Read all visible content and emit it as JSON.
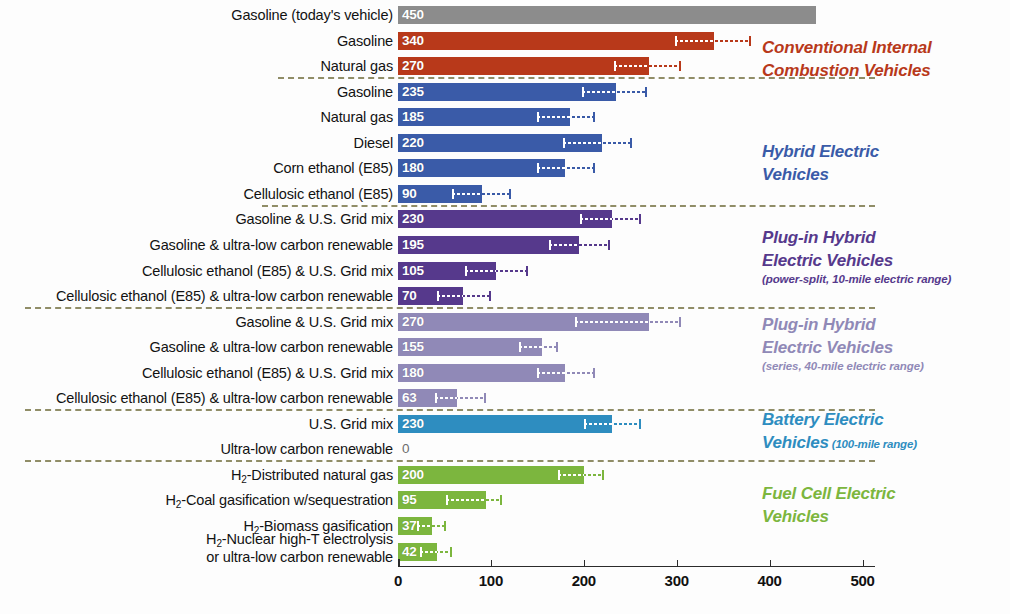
{
  "chart_data": {
    "type": "bar",
    "orientation": "horizontal",
    "title": "",
    "xlabel": "",
    "ylabel": "",
    "xlim": [
      0,
      500
    ],
    "xticks": [
      0,
      100,
      200,
      300,
      400,
      500
    ],
    "grid": false,
    "legend_position": "right",
    "categories": [
      "Gasoline (today's vehicle)",
      "Gasoline",
      "Natural gas",
      "Gasoline",
      "Natural gas",
      "Diesel",
      "Corn ethanol (E85)",
      "Cellulosic ethanol (E85)",
      "Gasoline & U.S. Grid mix",
      "Gasoline & ultra-low carbon renewable",
      "Cellulosic ethanol (E85) & U.S. Grid mix",
      "Cellulosic ethanol (E85) & ultra-low carbon renewable",
      "Gasoline & U.S. Grid mix",
      "Gasoline & ultra-low carbon renewable",
      "Cellulosic ethanol (E85) & U.S. Grid mix",
      "Cellulosic ethanol (E85) & ultra-low carbon renewable",
      "U.S. Grid mix",
      "Ultra-low carbon renewable",
      "H2-Distributed natural gas",
      "H2-Coal gasification w/sequestration",
      "H2-Biomass gasification",
      "H2-Nuclear high-T electrolysis or ultra-low carbon renewable"
    ],
    "values": [
      450,
      340,
      270,
      235,
      185,
      220,
      180,
      90,
      230,
      195,
      105,
      70,
      270,
      155,
      180,
      63,
      230,
      0,
      200,
      95,
      37,
      42
    ]
  },
  "colors": {
    "reference_gray": "#8c8c8c",
    "conventional_red": "#b8391a",
    "hybrid_blue": "#3a5ba8",
    "phev10_purple": "#56398c",
    "phev40_purple": "#9089b7",
    "bev_teal": "#2e8dc0",
    "fuelcell_green": "#7cb63e",
    "separator": "#7d7a4e",
    "axis": "#2b2b2b"
  },
  "rows": [
    {
      "label_html": "Gasoline (today's vehicle)",
      "value": 450,
      "value_text": "450",
      "color_key": "reference_gray",
      "err_lo": null,
      "err_hi": null,
      "value_dark": false
    },
    {
      "label_html": "Gasoline",
      "value": 340,
      "value_text": "340",
      "color_key": "conventional_red",
      "err_lo": 298,
      "err_hi": 380,
      "value_dark": false
    },
    {
      "label_html": "Natural gas",
      "value": 270,
      "value_text": "270",
      "color_key": "conventional_red",
      "err_lo": 232,
      "err_hi": 305,
      "value_dark": false
    },
    {
      "label_html": "Gasoline",
      "value": 235,
      "value_text": "235",
      "color_key": "hybrid_blue",
      "err_lo": 198,
      "err_hi": 268,
      "value_dark": false
    },
    {
      "label_html": "Natural gas",
      "value": 185,
      "value_text": "185",
      "color_key": "hybrid_blue",
      "err_lo": 150,
      "err_hi": 212,
      "value_dark": false
    },
    {
      "label_html": "Diesel",
      "value": 220,
      "value_text": "220",
      "color_key": "hybrid_blue",
      "err_lo": 178,
      "err_hi": 252,
      "value_dark": false
    },
    {
      "label_html": "Corn ethanol (E85)",
      "value": 180,
      "value_text": "180",
      "color_key": "hybrid_blue",
      "err_lo": 150,
      "err_hi": 212,
      "value_dark": false
    },
    {
      "label_html": "Cellulosic ethanol (E85)",
      "value": 90,
      "value_text": "90",
      "color_key": "hybrid_blue",
      "err_lo": 58,
      "err_hi": 122,
      "value_dark": false
    },
    {
      "label_html": "Gasoline &amp; U.S. Grid mix",
      "value": 230,
      "value_text": "230",
      "color_key": "phev10_purple",
      "err_lo": 196,
      "err_hi": 262,
      "value_dark": false
    },
    {
      "label_html": "Gasoline &amp; ultra-low carbon renewable",
      "value": 195,
      "value_text": "195",
      "color_key": "phev10_purple",
      "err_lo": 163,
      "err_hi": 228,
      "value_dark": false
    },
    {
      "label_html": "Cellulosic ethanol (E85) &amp; U.S. Grid mix",
      "value": 105,
      "value_text": "105",
      "color_key": "phev10_purple",
      "err_lo": 72,
      "err_hi": 140,
      "value_dark": false
    },
    {
      "label_html": "Cellulosic ethanol (E85) &amp; ultra-low carbon renewable",
      "value": 70,
      "value_text": "70",
      "color_key": "phev10_purple",
      "err_lo": 42,
      "err_hi": 100,
      "value_dark": false
    },
    {
      "label_html": "Gasoline &amp; U.S. Grid mix",
      "value": 270,
      "value_text": "270",
      "color_key": "phev40_purple",
      "err_lo": 190,
      "err_hi": 305,
      "value_dark": false
    },
    {
      "label_html": "Gasoline &amp; ultra-low carbon renewable",
      "value": 155,
      "value_text": "155",
      "color_key": "phev40_purple",
      "err_lo": 130,
      "err_hi": 172,
      "value_dark": false
    },
    {
      "label_html": "Cellulosic ethanol (E85) &amp; U.S. Grid mix",
      "value": 180,
      "value_text": "180",
      "color_key": "phev40_purple",
      "err_lo": 150,
      "err_hi": 212,
      "value_dark": false
    },
    {
      "label_html": "Cellulosic ethanol (E85) &amp; ultra-low carbon renewable",
      "value": 63,
      "value_text": "63",
      "color_key": "phev40_purple",
      "err_lo": 40,
      "err_hi": 95,
      "value_dark": false
    },
    {
      "label_html": "U.S. Grid mix",
      "value": 230,
      "value_text": "230",
      "color_key": "bev_teal",
      "err_lo": 200,
      "err_hi": 262,
      "value_dark": false
    },
    {
      "label_html": "Ultra-low carbon renewable",
      "value": 0,
      "value_text": "0",
      "color_key": "bev_teal",
      "err_lo": null,
      "err_hi": null,
      "value_dark": true
    },
    {
      "label_html": "H<sub>2</sub>-Distributed natural gas",
      "value": 200,
      "value_text": "200",
      "color_key": "fuelcell_green",
      "err_lo": 172,
      "err_hi": 222,
      "value_dark": false
    },
    {
      "label_html": "H<sub>2</sub>-Coal gasification w/sequestration",
      "value": 95,
      "value_text": "95",
      "color_key": "fuelcell_green",
      "err_lo": 52,
      "err_hi": 112,
      "value_dark": false
    },
    {
      "label_html": "H<sub>2</sub>-Biomass gasification",
      "value": 37,
      "value_text": "37",
      "color_key": "fuelcell_green",
      "err_lo": 20,
      "err_hi": 52,
      "value_dark": false
    },
    {
      "label_html": "H<sub>2</sub>-Nuclear high-T electrolysis<br>or ultra-low carbon renewable",
      "value": 42,
      "value_text": "42",
      "color_key": "fuelcell_green",
      "err_lo": 24,
      "err_hi": 58,
      "value_dark": false
    }
  ],
  "separators": [
    {
      "after_row": 2
    },
    {
      "after_row": 7
    },
    {
      "after_row": 11
    },
    {
      "after_row": 15
    },
    {
      "after_row": 17
    }
  ],
  "groups": [
    {
      "name": "conventional-internal-combustion-vehicles",
      "title": "Conventional Internal\nCombustion Vehicles",
      "subtitle": "",
      "subtitle_inline": "",
      "color_key": "conventional_red",
      "top": 36
    },
    {
      "name": "hybrid-electric-vehicles",
      "title": "Hybrid Electric\nVehicles",
      "subtitle": "",
      "subtitle_inline": "",
      "color_key": "hybrid_blue",
      "top": 140
    },
    {
      "name": "plug-in-hybrid-electric-vehicles-power-split",
      "title": "Plug-in Hybrid\nElectric Vehicles",
      "subtitle": "(power-split, 10-mile electric range)",
      "subtitle_inline": "",
      "color_key": "phev10_purple",
      "top": 226
    },
    {
      "name": "plug-in-hybrid-electric-vehicles-series",
      "title": "Plug-in Hybrid\nElectric Vehicles",
      "subtitle": "(series, 40-mile electric range)",
      "subtitle_inline": "",
      "color_key": "phev40_purple",
      "top": 313
    },
    {
      "name": "battery-electric-vehicles",
      "title": "Battery Electric\nVehicles",
      "subtitle": "",
      "subtitle_inline": " (100-mile range)",
      "color_key": "bev_teal",
      "top": 408
    },
    {
      "name": "fuel-cell-electric-vehicles",
      "title": "Fuel Cell Electric\nVehicles",
      "subtitle": "",
      "subtitle_inline": "",
      "color_key": "fuelcell_green",
      "top": 482
    }
  ],
  "axis": {
    "ticks": [
      "0",
      "100",
      "200",
      "300",
      "400",
      "500"
    ],
    "min": 0,
    "max": 500
  }
}
